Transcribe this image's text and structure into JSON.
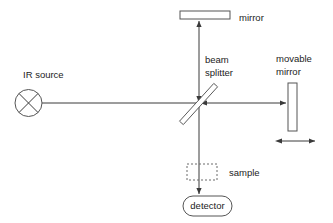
{
  "diagram": {
    "background_color": "#ffffff",
    "line_color": "#3a3a3a",
    "shape_stroke_color": "#555555",
    "text_color": "#222222",
    "labels": {
      "ir_source": "IR source",
      "mirror": "mirror",
      "beam_splitter_line1": "beam",
      "beam_splitter_line2": "splitter",
      "movable_mirror_line1": "movable",
      "movable_mirror_line2": "mirror",
      "sample": "sample",
      "detector": "detector"
    },
    "components": [
      {
        "name": "ir-source",
        "shape": "circle-with-x",
        "cx": 28.5,
        "cy": 103,
        "r": 13.5
      },
      {
        "name": "fixed-mirror",
        "shape": "rectangle",
        "x": 180,
        "y": 11,
        "width": 50,
        "height": 8
      },
      {
        "name": "beam-splitter",
        "shape": "diagonal-plate",
        "x1": 181,
        "y1": 123,
        "x2": 216,
        "y2": 85
      },
      {
        "name": "movable-mirror",
        "shape": "rectangle",
        "x": 288,
        "y": 83,
        "width": 9,
        "height": 48
      },
      {
        "name": "sample",
        "shape": "dashed-rectangle",
        "x": 187,
        "y": 164,
        "width": 30,
        "height": 16
      },
      {
        "name": "detector",
        "shape": "stadium",
        "x": 183,
        "y": 196,
        "width": 49,
        "height": 20
      }
    ],
    "beams": [
      {
        "name": "source-to-splitter",
        "orientation": "horizontal",
        "x1": 42,
        "y1": 103,
        "x2": 199,
        "y2": 103,
        "arrow": "none"
      },
      {
        "name": "splitter-to-movable-mirror",
        "orientation": "horizontal",
        "x1": 199,
        "y1": 103,
        "x2": 288,
        "y2": 103,
        "arrow": "end"
      },
      {
        "name": "movable-mirror-return",
        "orientation": "horizontal",
        "arrow": "left-into-splitter"
      },
      {
        "name": "splitter-to-fixed-mirror",
        "orientation": "vertical",
        "x1": 199,
        "y1": 103,
        "x2": 199,
        "y2": 19,
        "arrow": "end-up"
      },
      {
        "name": "fixed-mirror-return",
        "orientation": "vertical",
        "arrow": "down-into-splitter"
      },
      {
        "name": "splitter-to-detector",
        "orientation": "vertical",
        "x1": 199,
        "y1": 103,
        "x2": 199,
        "y2": 196,
        "arrow": "end-down"
      }
    ],
    "motion_indicator": {
      "name": "movable-mirror-travel-arrow",
      "type": "double-headed-arrow",
      "x1": 275,
      "x2": 321,
      "y": 141
    }
  }
}
